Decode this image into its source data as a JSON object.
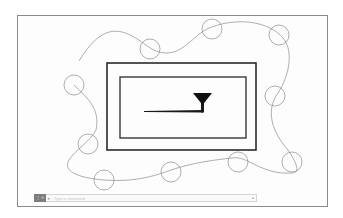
{
  "app": {
    "type": "cad-drawing-canvas"
  },
  "canvas": {
    "frame_color": "#8a8a8a",
    "stroke_color": "#8c8c8c",
    "rect_color": "#2a2a2a"
  },
  "drawing": {
    "outer_rect": {
      "x": 107,
      "y": 63,
      "w": 149,
      "h": 87
    },
    "inner_rect": {
      "x": 120,
      "y": 77,
      "w": 126,
      "h": 61
    },
    "symbol": "welding-symbol-fillet",
    "circles": [
      {
        "cx": 150,
        "cy": 49,
        "r": 10
      },
      {
        "cx": 212,
        "cy": 29,
        "r": 10
      },
      {
        "cx": 279,
        "cy": 35,
        "r": 10
      },
      {
        "cx": 74,
        "cy": 85,
        "r": 10
      },
      {
        "cx": 275,
        "cy": 96,
        "r": 10
      },
      {
        "cx": 88,
        "cy": 144,
        "r": 10
      },
      {
        "cx": 238,
        "cy": 162,
        "r": 10
      },
      {
        "cx": 292,
        "cy": 162,
        "r": 10
      },
      {
        "cx": 104,
        "cy": 180,
        "r": 10
      },
      {
        "cx": 171,
        "cy": 172,
        "r": 10
      }
    ]
  },
  "command_line": {
    "button_label": "⋮✕",
    "glyph": "▸",
    "placeholder": "Type a command",
    "arrow": "▲"
  }
}
